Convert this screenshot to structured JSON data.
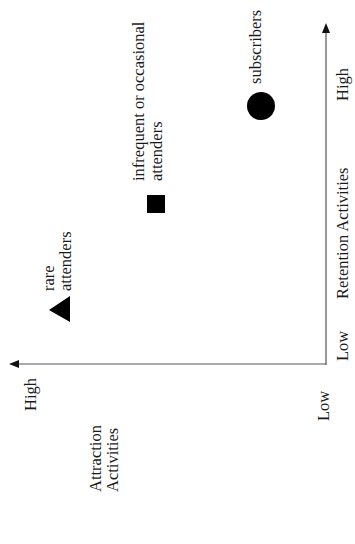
{
  "diagram": {
    "orientation": "rotated-90-ccw",
    "x_axis": {
      "title": "Retention Activities",
      "low": "Low",
      "high": "High"
    },
    "y_axis": {
      "title_line1": "Attraction",
      "title_line2": "Activities",
      "low": "Low",
      "high": "High"
    },
    "segments": [
      {
        "shape": "triangle",
        "label_line1": "rare",
        "label_line2": "attenders"
      },
      {
        "shape": "square",
        "label_line1": "infrequent or occasional",
        "label_line2": "attenders"
      },
      {
        "shape": "circle",
        "label_line1": "subscribers"
      }
    ],
    "colors": {
      "ink": "#111111",
      "axis": "#444444",
      "background": "#ffffff"
    }
  }
}
